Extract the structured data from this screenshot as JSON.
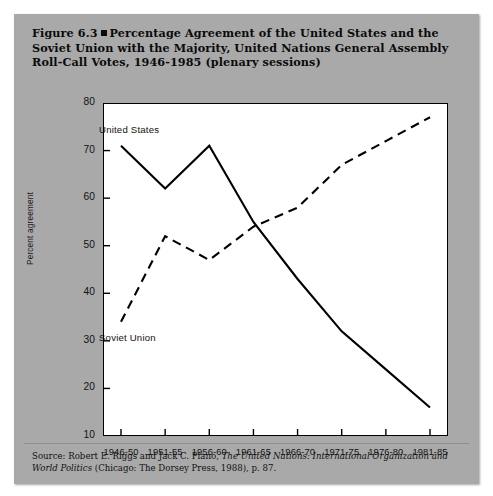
{
  "figure": {
    "number": "Figure 6.3",
    "bullet": "square-bullet",
    "title": "Percentage Agreement of the United States and the Soviet Union with the Majority, United Nations General Assembly Roll-Call Votes, 1946-1985 (plenary sessions)",
    "title_line1": "Figure 6.3",
    "title_line2": "Percentage Agreement of the United States and the",
    "title_line3": "Soviet Union with the Majority, United Nations General Assembly",
    "title_line4": "Roll-Call Votes, 1946-1985 (plenary sessions)"
  },
  "source": {
    "prefix": "Source: Robert E. Riggs and Jack C. Plano,",
    "italic_title": "The United Nations: International Organization and World Politics",
    "suffix": "(Chicago: The Dorsey Press, 1988), p. 87."
  },
  "colors": {
    "figure_background": "#a9a9a9",
    "plot_background": "#ffffff",
    "axis": "#000000",
    "series_line": "#000000",
    "page": "#ffffff"
  },
  "chart_data": {
    "type": "line",
    "title": "Percentage Agreement of the United States and the Soviet Union with the Majority, United Nations General Assembly Roll-Call Votes, 1946-1985 (plenary sessions)",
    "xlabel": "",
    "ylabel": "Percent agreement",
    "categories": [
      "1946-50",
      "1951-55",
      "1956-60",
      "1961-65",
      "1966-70",
      "1971-75",
      "1976-80",
      "1981-85"
    ],
    "ylim": [
      10,
      80
    ],
    "yticks": [
      10,
      20,
      30,
      40,
      50,
      60,
      70,
      80
    ],
    "grid": false,
    "legend": "inline-labels",
    "series": [
      {
        "name": "United States",
        "style": "solid",
        "values": [
          71,
          62,
          71,
          55,
          43,
          32,
          24,
          16
        ]
      },
      {
        "name": "Soviet Union",
        "style": "dashed",
        "values": [
          34,
          52,
          47,
          54,
          58,
          67,
          72,
          77
        ]
      }
    ]
  }
}
